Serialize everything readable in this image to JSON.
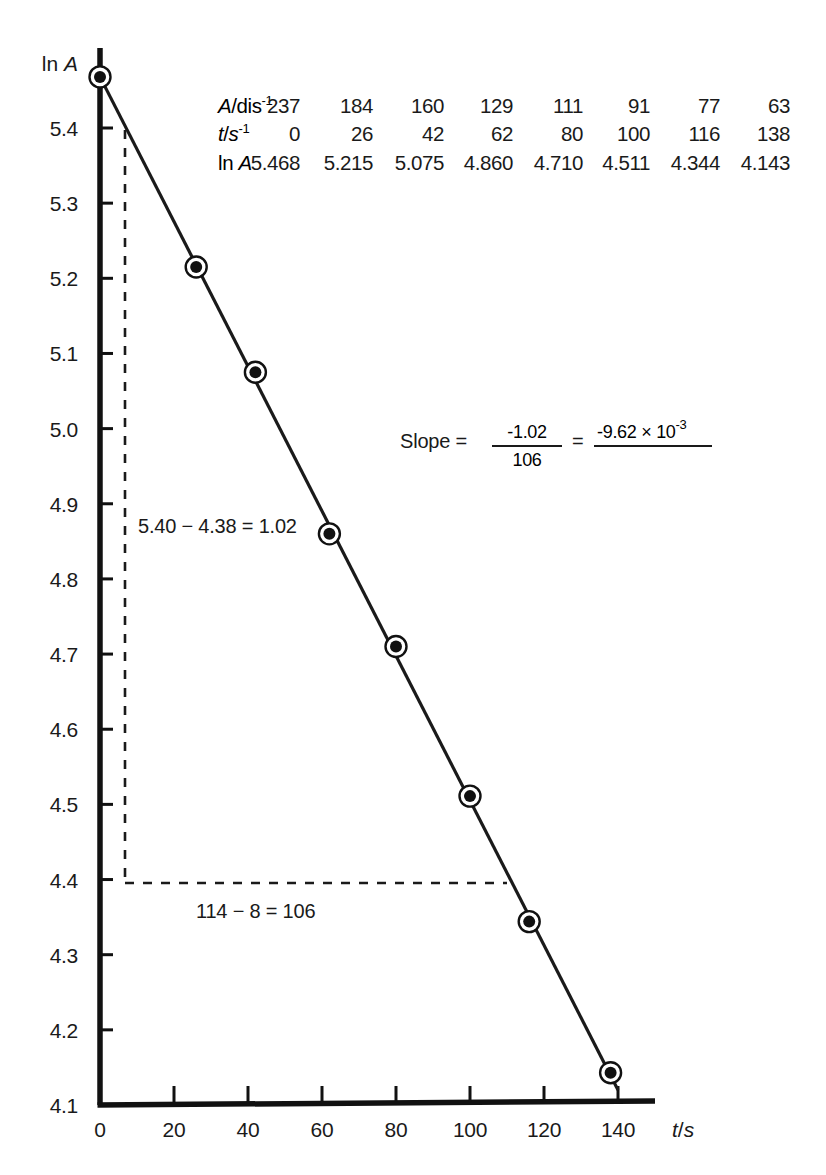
{
  "chart_data": {
    "type": "scatter",
    "title": "",
    "xlabel": "t/s",
    "ylabel": "ln A",
    "xlim": [
      0,
      148
    ],
    "ylim": [
      4.1,
      5.47
    ],
    "grid": false,
    "legend": null,
    "x": [
      0,
      26,
      42,
      62,
      80,
      100,
      116,
      138
    ],
    "y": [
      5.468,
      5.215,
      5.075,
      4.86,
      4.71,
      4.511,
      4.344,
      4.143
    ],
    "series": [
      {
        "name": "ln A vs t",
        "x": [
          0,
          26,
          42,
          62,
          80,
          100,
          116,
          138
        ],
        "values": [
          5.468,
          5.215,
          5.075,
          4.86,
          4.71,
          4.511,
          4.344,
          4.143
        ]
      }
    ],
    "fit_line": {
      "slope": -0.00962,
      "intercept": 5.468,
      "x_start": 0,
      "y_start": 5.468,
      "x_end": 140,
      "y_end": 4.12
    },
    "xticks": [
      0,
      20,
      40,
      60,
      80,
      100,
      120,
      140
    ],
    "xtick_labels": [
      "0",
      "20",
      "40",
      "60",
      "80",
      "100",
      "120",
      "140"
    ],
    "yticks": [
      4.1,
      4.2,
      4.3,
      4.4,
      4.5,
      4.6,
      4.7,
      4.8,
      4.9,
      5.0,
      5.1,
      5.2,
      5.3,
      5.4
    ],
    "ytick_labels": [
      "4.1",
      "4.2",
      "4.3",
      "4.4",
      "4.5",
      "4.6",
      "4.7",
      "4.8",
      "4.9",
      "5.0",
      "5.1",
      "5.2",
      "5.3",
      "5.4"
    ]
  },
  "axes": {
    "y_title_prefix": "ln ",
    "y_title_symbol": "A",
    "x_title_prefix": "t",
    "x_title_slash": "/",
    "x_title_symbol": "s"
  },
  "data_table": {
    "rows": [
      {
        "label_main": "A",
        "label_rest": "/dis",
        "label_sup": "-1",
        "values": [
          "237",
          "184",
          "160",
          "129",
          "111",
          "91",
          "77",
          "63"
        ]
      },
      {
        "label_main": "t",
        "label_rest": "/s",
        "label_sup": "-1",
        "values": [
          "0",
          "26",
          "42",
          "62",
          "80",
          "100",
          "116",
          "138"
        ]
      },
      {
        "label_main": "ln ",
        "label_rest": "A",
        "label_sup": "",
        "values": [
          "5.468",
          "5.215",
          "5.075",
          "4.860",
          "4.710",
          "4.511",
          "4.344",
          "4.143"
        ]
      }
    ]
  },
  "annotations": {
    "delta_y": "5.40 − 4.38 = 1.02",
    "delta_x": "114 − 8 = 106",
    "slope_label": "Slope  =",
    "slope_numerator": "-1.02",
    "slope_denominator": "106",
    "slope_equals": "=",
    "slope_result_mantissa": "-9.62 × 10",
    "slope_result_exponent": "-3"
  },
  "colors": {
    "ink": "#1a1a1a",
    "axis": "#111111",
    "background": "#ffffff",
    "marker_fill": "#111111",
    "marker_ring": "#111111"
  }
}
